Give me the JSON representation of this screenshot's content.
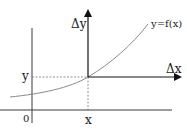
{
  "diagram": {
    "title": "",
    "labels": {
      "delta_y": "Δy",
      "delta_x": "Δx",
      "function": "y=f(x)",
      "y_value": "y",
      "x_value": "x",
      "origin": "0"
    },
    "colors": {
      "axis": "#2a2a2a",
      "curve": "#8a8a8a",
      "dashed": "#777777",
      "text": "#1a1a1a"
    }
  }
}
